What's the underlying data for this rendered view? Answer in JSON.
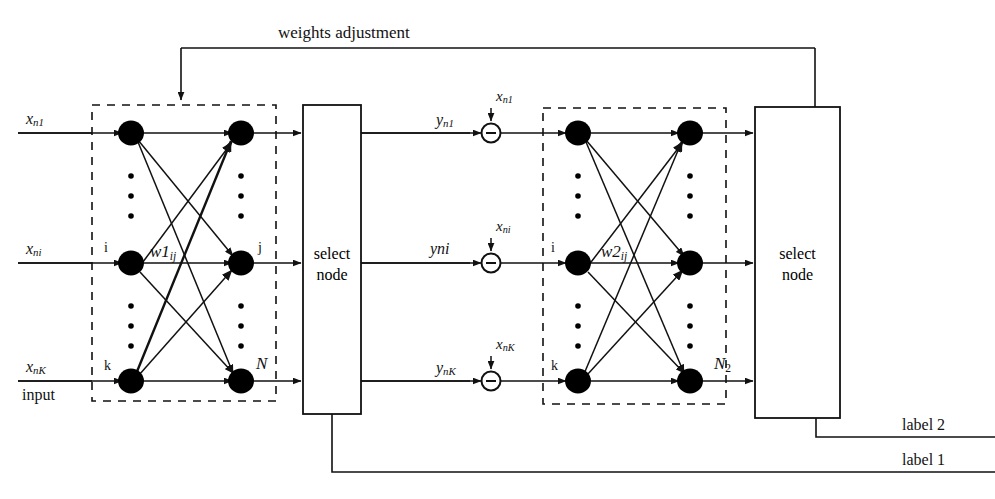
{
  "diagram": {
    "colors": {
      "ink": "#111111",
      "background": "#ffffff",
      "node_fill": "#000000"
    },
    "feedback": {
      "weights_adjustment_label": "weights adjustment",
      "label_2": "label 2",
      "label_1": "label 1"
    },
    "input_section": {
      "caption": "input",
      "signals": [
        {
          "id": "x1",
          "text_main": "x",
          "text_sub": "n1",
          "row": 1
        },
        {
          "id": "xi",
          "text_main": "x",
          "text_sub": "ni",
          "row": 2
        },
        {
          "id": "xk",
          "text_main": "x",
          "text_sub": "nK",
          "row": 3
        }
      ]
    },
    "network1": {
      "weight_label": {
        "main": "w1",
        "sub": "ij"
      },
      "input_node_labels": [
        "",
        "i",
        "k"
      ],
      "output_node_labels": [
        "",
        "j",
        "N"
      ]
    },
    "select_node_1": {
      "line1": "select",
      "line2": "node"
    },
    "error_junctions": {
      "operator": "−",
      "rows": [
        {
          "y_main": "y",
          "y_sub": "n1",
          "x_main": "x",
          "x_sub": "n1"
        },
        {
          "y_main": "y",
          "y_sub": "ni",
          "x_main": "x",
          "x_sub": "ni"
        },
        {
          "y_main": "y",
          "y_sub": "nK",
          "x_main": "x",
          "x_sub": "nK"
        }
      ]
    },
    "network2": {
      "weight_label": {
        "main": "w2",
        "sub": "ij"
      },
      "input_node_labels": [
        "",
        "i",
        "k"
      ],
      "output_node_labels": [
        "",
        "",
        "N2_sub"
      ],
      "n2_main": "N",
      "n2_sub": "2"
    },
    "select_node_2": {
      "line1": "select",
      "line2": "node"
    }
  }
}
